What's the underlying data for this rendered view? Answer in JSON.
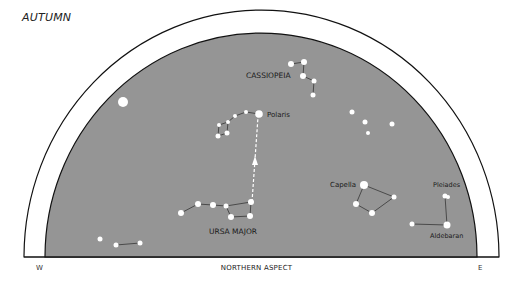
{
  "title": "AUTUMN",
  "footer": {
    "west": "W",
    "aspect": "NORTHERN ASPECT",
    "east": "E"
  },
  "colors": {
    "sky": "#959595",
    "star": "#ffffff",
    "line": "#444444",
    "arc": "#111111"
  },
  "constellations": [
    {
      "name": "CASSIOPEIA"
    },
    {
      "name": "URSA MAJOR"
    }
  ],
  "stars": [
    {
      "name": "Polaris"
    },
    {
      "name": "Capella"
    },
    {
      "name": "Pleiades"
    },
    {
      "name": "Aldebaran"
    }
  ]
}
